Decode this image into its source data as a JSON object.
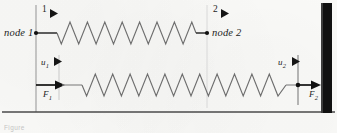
{
  "figure": {
    "caption_text": "Figure",
    "background_color": "#fbfbf9",
    "ink_color": "#3a3a3a",
    "dark_ink_color": "#1c1c1c",
    "wall_color": "#111111",
    "guide_color": "#cdcdcd"
  },
  "labels": {
    "node1": "node 1",
    "node2": "node 2",
    "dof1_number": "1",
    "dof2_number": "2",
    "u1_base": "u",
    "u1_sub": "1",
    "u2_base": "u",
    "u2_sub": "2",
    "F1_base": "F",
    "F1_sub": "1",
    "F2_base": "F",
    "F2_sub": "2"
  },
  "icons": {
    "dof1_arrow": "right-triangle-arrow-icon",
    "dof2_arrow": "right-triangle-arrow-icon",
    "u1_arrow": "right-triangle-arrow-icon",
    "u2_arrow": "right-triangle-arrow-icon",
    "F1_arrow": "right-arrow-icon",
    "F2_arrow": "right-arrow-icon",
    "node1_dot": "node-dot-icon",
    "node2_dot": "node-dot-icon",
    "node3_dot": "node-dot-icon"
  },
  "geometry": {
    "left_guide_x": 36,
    "node2_guide_x": 207,
    "u2_guide_x": 298,
    "wall_x": 321,
    "wall_width": 11,
    "top_spring_y": 33,
    "bottom_spring_y": 85,
    "baseline_y": 112,
    "top_spring_start_x": 57,
    "top_spring_end_x": 196,
    "top_spring_peaks": 8,
    "bottom_spring_start_x": 82,
    "bottom_spring_end_x": 286,
    "bottom_spring_peaks": 11,
    "spring_amplitude": 11
  }
}
